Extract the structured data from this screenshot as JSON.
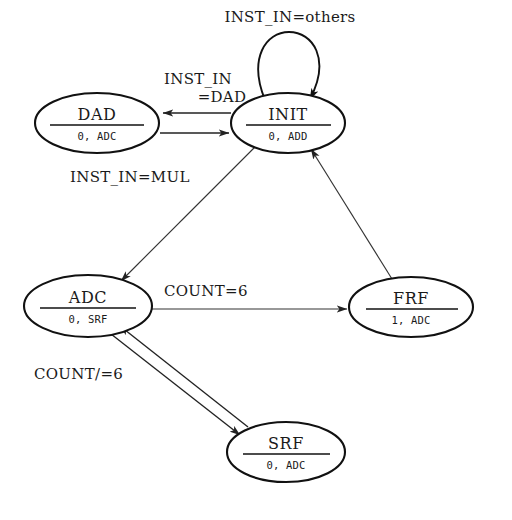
{
  "diagram": {
    "type": "state-machine",
    "background_color": "#ffffff",
    "line_color": "#111111",
    "text_color": "#1a1a1a",
    "states": [
      {
        "id": "DAD",
        "name": "DAD",
        "output": "0, ADC",
        "cx": 97,
        "cy": 123,
        "rx": 62,
        "ry": 30
      },
      {
        "id": "INIT",
        "name": "INIT",
        "output": "0, ADD",
        "cx": 288,
        "cy": 123,
        "rx": 57,
        "ry": 30
      },
      {
        "id": "ADC",
        "name": "ADC",
        "output": "0, SRF",
        "cx": 88,
        "cy": 306,
        "rx": 64,
        "ry": 31
      },
      {
        "id": "FRF",
        "name": "FRF",
        "output": "1, ADC",
        "cx": 411,
        "cy": 307,
        "rx": 62,
        "ry": 30
      },
      {
        "id": "SRF",
        "name": "SRF",
        "output": "0, ADC",
        "cx": 286,
        "cy": 452,
        "rx": 59,
        "ry": 30
      }
    ],
    "transitions": [
      {
        "id": "init-self",
        "from": "INIT",
        "to": "INIT",
        "label": "INST_IN=others",
        "label_x": 290,
        "label_y": 22,
        "label_anchor": "middle"
      },
      {
        "id": "init-to-dad",
        "from": "INIT",
        "to": "DAD",
        "label": "INST_IN",
        "label2": "=DAD",
        "label_x": 198,
        "label_y": 84,
        "label2_x": 222,
        "label2_y": 102,
        "label_anchor": "middle"
      },
      {
        "id": "dad-to-init",
        "from": "DAD",
        "to": "INIT",
        "label": "",
        "label_x": 0,
        "label_y": 0,
        "label_anchor": "middle"
      },
      {
        "id": "init-to-adc",
        "from": "INIT",
        "to": "ADC",
        "label": "INST_IN=MUL",
        "label_x": 70,
        "label_y": 182,
        "label_anchor": "start"
      },
      {
        "id": "adc-to-frf",
        "from": "ADC",
        "to": "FRF",
        "label": "COUNT=6",
        "label_x": 164,
        "label_y": 296,
        "label_anchor": "start"
      },
      {
        "id": "frf-to-init",
        "from": "FRF",
        "to": "INIT",
        "label": "",
        "label_x": 0,
        "label_y": 0,
        "label_anchor": "middle"
      },
      {
        "id": "adc-to-srf",
        "from": "ADC",
        "to": "SRF",
        "label": "COUNT/=6",
        "label_x": 34,
        "label_y": 379,
        "label_anchor": "start"
      },
      {
        "id": "srf-to-adc",
        "from": "SRF",
        "to": "ADC",
        "label": "",
        "label_x": 0,
        "label_y": 0,
        "label_anchor": "middle"
      }
    ]
  }
}
